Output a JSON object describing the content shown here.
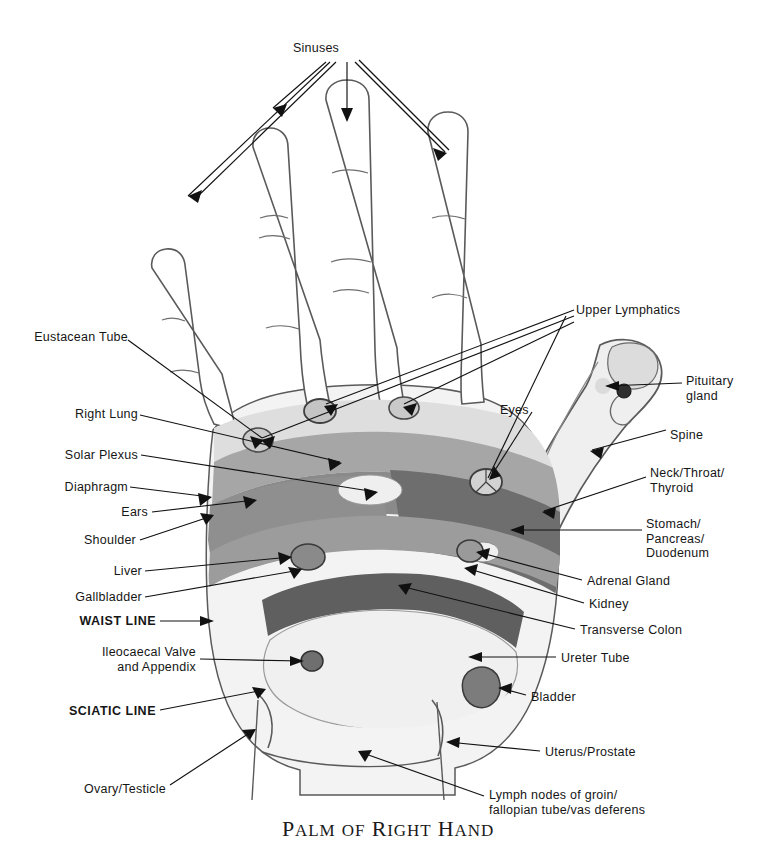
{
  "figure": {
    "title": "Palm of Right Hand",
    "title_words": [
      "Palm",
      "of",
      "Right",
      "Hand"
    ],
    "kind": "reflexology-hand-chart"
  },
  "palette": {
    "background": "#ffffff",
    "outline": "#4a4a4a",
    "leader_line": "#111111",
    "text": "#161616",
    "zone_light": "#d8d8d8",
    "zone_pale": "#e8e8e8",
    "zone_medium": "#a6a6a6",
    "zone_mid_dark": "#8d8d8d",
    "zone_dark": "#6e6e6e",
    "zone_darkest": "#5c5c5c",
    "palm_base": "#f2f2f2",
    "point_fill": "#c9c9c9",
    "point_dark": "#3a3a3a"
  },
  "labels": {
    "top": [
      {
        "id": "sinuses",
        "text": "Sinuses",
        "x": 316,
        "y": 48,
        "align": "center",
        "bold": false
      }
    ],
    "left": [
      {
        "id": "eustacean-tube",
        "text": "Eustacean Tube",
        "x": 30,
        "y": 337,
        "bold": false
      },
      {
        "id": "right-lung",
        "text": "Right Lung",
        "x": 67,
        "y": 414,
        "bold": false
      },
      {
        "id": "solar-plexus",
        "text": "Solar Plexus",
        "x": 57,
        "y": 451,
        "bold": false
      },
      {
        "id": "diaphragm",
        "text": "Diaphragm",
        "x": 62,
        "y": 482,
        "bold": false
      },
      {
        "id": "ears",
        "text": "Ears",
        "x": 120,
        "y": 508,
        "bold": false
      },
      {
        "id": "shoulder",
        "text": "Shoulder",
        "x": 77,
        "y": 537,
        "bold": false
      },
      {
        "id": "liver",
        "text": "Liver",
        "x": 110,
        "y": 570,
        "bold": false
      },
      {
        "id": "gallbladder",
        "text": "Gallbladder",
        "x": 68,
        "y": 594,
        "bold": false
      },
      {
        "id": "waist-line",
        "text": "WAIST LINE",
        "x": 73,
        "y": 618,
        "bold": true
      },
      {
        "id": "ileocaecal-valve",
        "text": "Ileocaecal Valve\nand Appendix",
        "x": 95,
        "y": 650,
        "bold": false
      },
      {
        "id": "sciatic-line",
        "text": "SCIATIC LINE",
        "x": 74,
        "y": 708,
        "bold": true
      },
      {
        "id": "ovary-testicle",
        "text": "Ovary/Testicle",
        "x": 72,
        "y": 787,
        "bold": false
      }
    ],
    "right": [
      {
        "id": "upper-lymphatics",
        "text": "Upper Lymphatics",
        "x": 576,
        "y": 305,
        "bold": false
      },
      {
        "id": "pituitary-gland",
        "text": "Pituitary\ngland",
        "x": 686,
        "y": 375,
        "bold": false
      },
      {
        "id": "spine",
        "text": "Spine",
        "x": 670,
        "y": 429,
        "bold": false
      },
      {
        "id": "neck-throat-thyroid",
        "text": "Neck/Throat/\nThyroid",
        "x": 650,
        "y": 468,
        "bold": false
      },
      {
        "id": "stomach-pancreas-duodenum",
        "text": "Stomach/\nPancreas/\nDuodenum",
        "x": 646,
        "y": 519,
        "bold": false
      },
      {
        "id": "adrenal-gland",
        "text": "Adrenal Gland",
        "x": 587,
        "y": 578,
        "bold": false
      },
      {
        "id": "kidney",
        "text": "Kidney",
        "x": 589,
        "y": 601,
        "bold": false
      },
      {
        "id": "transverse-colon",
        "text": "Transverse Colon",
        "x": 580,
        "y": 627,
        "bold": false
      },
      {
        "id": "ureter-tube",
        "text": "Ureter Tube",
        "x": 561,
        "y": 655,
        "bold": false
      },
      {
        "id": "bladder",
        "text": "Bladder",
        "x": 531,
        "y": 694,
        "bold": false
      },
      {
        "id": "uterus-prostate",
        "text": "Uterus/Prostate",
        "x": 545,
        "y": 748,
        "bold": false
      },
      {
        "id": "lymph-nodes-groin",
        "text": "Lymph nodes of groin/\nfallopian tube/vas deferens",
        "x": 489,
        "y": 791,
        "bold": false
      }
    ],
    "inner": [
      {
        "id": "eyes",
        "text": "Eyes",
        "x": 500,
        "y": 405,
        "bold": false
      }
    ]
  },
  "zones": [
    {
      "id": "lung-band",
      "name": "Right Lung zone",
      "tone": "zone_medium"
    },
    {
      "id": "solar-plexus-band",
      "name": "Solar Plexus zone",
      "tone": "zone_mid_dark"
    },
    {
      "id": "diaphragm-line",
      "name": "Diaphragm line",
      "tone": "zone_dark"
    },
    {
      "id": "liver-region",
      "name": "Liver region",
      "tone": "zone_dark"
    },
    {
      "id": "stomach-region",
      "name": "Stomach/Pancreas/Duodenum region",
      "tone": "zone_darkest"
    },
    {
      "id": "transverse-colon-band",
      "name": "Transverse Colon band",
      "tone": "zone_dark"
    },
    {
      "id": "palm-pad",
      "name": "Lower palm pad",
      "tone": "palm_base"
    }
  ],
  "points": [
    {
      "id": "eustacean-tube-point",
      "name": "Eustacean tube point"
    },
    {
      "id": "ear-point",
      "name": "Ear point"
    },
    {
      "id": "eye-point",
      "name": "Eye point"
    },
    {
      "id": "pituitary-point",
      "name": "Pituitary gland point"
    },
    {
      "id": "ileocaecal-point",
      "name": "Ileocaecal valve point"
    },
    {
      "id": "bladder-point",
      "name": "Bladder point"
    },
    {
      "id": "adrenal-point",
      "name": "Adrenal gland point"
    }
  ]
}
